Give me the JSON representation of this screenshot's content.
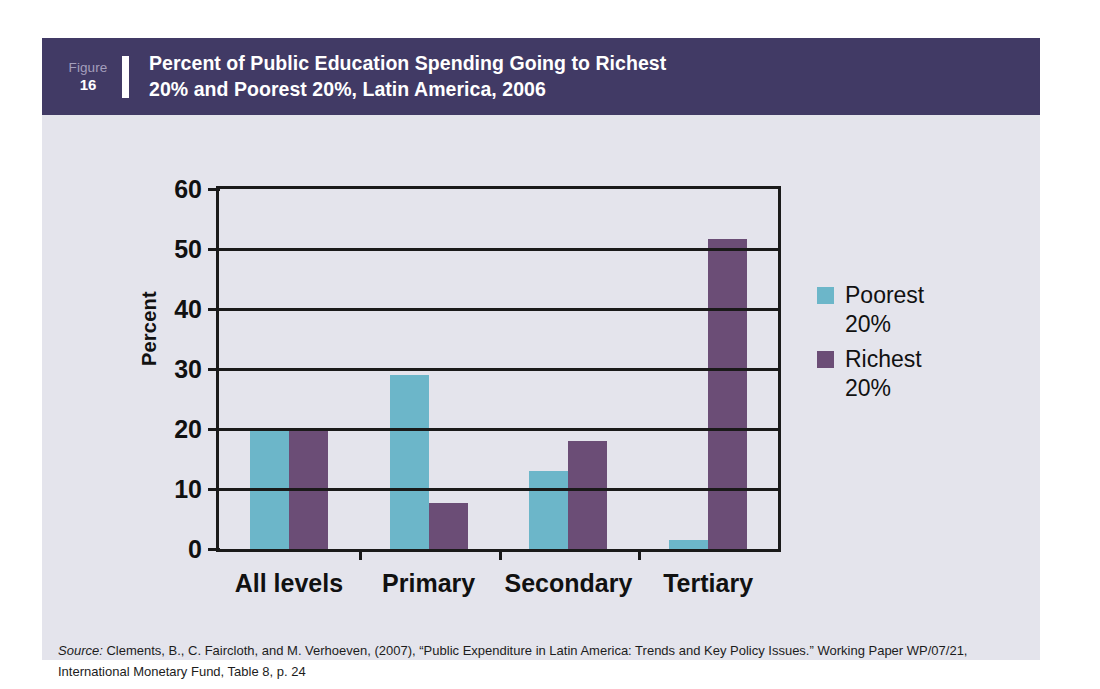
{
  "figure": {
    "number_label": "Figure",
    "number_value": "16",
    "title_line1": "Percent of Public Education Spending Going to Richest",
    "title_line2": "20% and Poorest 20%, Latin America, 2006",
    "header_color": "#413a65"
  },
  "source": {
    "label": "Source:",
    "text": " Clements, B., C. Faircloth, and M. Verhoeven, (2007), “Public Expenditure in Latin America: Trends and Key Policy Issues.” Working Paper WP/07/21, International Monetary Fund, Table 8, p. 24"
  },
  "legend": {
    "items": [
      {
        "label": "Poorest\n20%",
        "color": "#6cb6c9",
        "key": "poorest"
      },
      {
        "label": "Richest\n20%",
        "color": "#6b4d76",
        "key": "richest"
      }
    ]
  },
  "axis": {
    "ylabel": "Percent",
    "yticks": [
      "0",
      "10",
      "20",
      "30",
      "40",
      "50",
      "60"
    ]
  },
  "chart_data": {
    "type": "bar",
    "title": "Percent of Public Education Spending Going to Richest 20% and Poorest 20%, Latin America, 2006",
    "xlabel": "",
    "ylabel": "Percent",
    "ylim": [
      0,
      60
    ],
    "ytick_step": 10,
    "grid": true,
    "legend_position": "right",
    "categories": [
      "All levels",
      "Primary",
      "Secondary",
      "Tertiary"
    ],
    "series": [
      {
        "name": "Poorest 20%",
        "color": "#6cb6c9",
        "values": [
          20.2,
          29.0,
          13.0,
          1.5
        ]
      },
      {
        "name": "Richest 20%",
        "color": "#6b4d76",
        "values": [
          20.2,
          7.7,
          18.0,
          51.7
        ]
      }
    ]
  }
}
